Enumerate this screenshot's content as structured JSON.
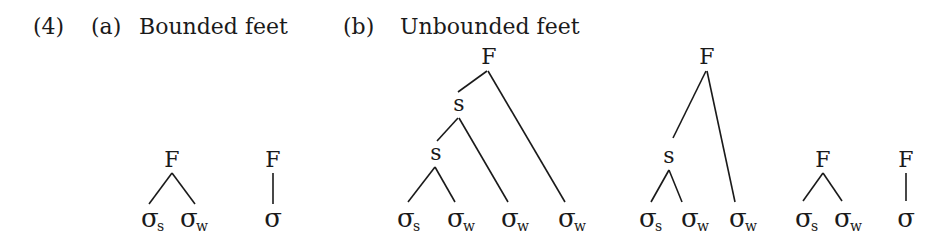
{
  "example_number": "(4)",
  "panels": {
    "a": {
      "label": "(a)",
      "title": "Bounded feet"
    },
    "b": {
      "label": "(b)",
      "title": "Unbounded feet"
    }
  },
  "symbols": {
    "foot": "F",
    "strong_node": "s",
    "syllable": "σ",
    "strong_sub": "s",
    "weak_sub": "w"
  },
  "trees": [
    {
      "id": "a-binary",
      "panel": "a",
      "root": "F",
      "leaves": [
        "σs",
        "σw"
      ]
    },
    {
      "id": "a-unary",
      "panel": "a",
      "root": "F",
      "leaves": [
        "σ"
      ]
    },
    {
      "id": "b-left-branching-4",
      "panel": "b",
      "root": "F",
      "internal": [
        "s",
        "s"
      ],
      "leaves": [
        "σs",
        "σw",
        "σw",
        "σw"
      ]
    },
    {
      "id": "b-left-branching-3",
      "panel": "b",
      "root": "F",
      "internal": [
        "s"
      ],
      "leaves": [
        "σs",
        "σw",
        "σw"
      ]
    },
    {
      "id": "b-binary",
      "panel": "b",
      "root": "F",
      "leaves": [
        "σs",
        "σw"
      ]
    },
    {
      "id": "b-unary",
      "panel": "b",
      "root": "F",
      "leaves": [
        "σ"
      ]
    }
  ]
}
